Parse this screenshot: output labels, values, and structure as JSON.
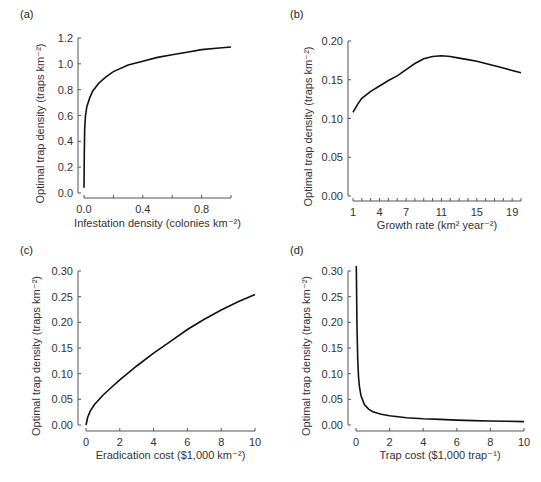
{
  "chart_data": [
    {
      "panel": "(a)",
      "type": "line",
      "xlabel": "Infestation density (colonies km⁻²)",
      "ylabel": "Optimal trap density (traps km⁻²)",
      "xlim": [
        0,
        1.0
      ],
      "ylim": [
        0,
        1.2
      ],
      "xticks": [
        "0.0",
        "0.4",
        "0.8"
      ],
      "yticks": [
        "0.0",
        "0.2",
        "0.4",
        "0.6",
        "0.8",
        "1.0",
        "1.2"
      ],
      "x": [
        0.0,
        0.002,
        0.005,
        0.01,
        0.02,
        0.04,
        0.06,
        0.1,
        0.15,
        0.2,
        0.3,
        0.4,
        0.5,
        0.6,
        0.7,
        0.8,
        0.9,
        1.0
      ],
      "y": [
        0.04,
        0.3,
        0.5,
        0.6,
        0.67,
        0.74,
        0.79,
        0.85,
        0.9,
        0.94,
        0.99,
        1.02,
        1.05,
        1.07,
        1.09,
        1.11,
        1.12,
        1.13
      ]
    },
    {
      "panel": "(b)",
      "type": "line",
      "xlabel": "Growth rate (km² year⁻²)",
      "ylabel": "Optimal trap density (traps km⁻²)",
      "xlim": [
        1,
        20
      ],
      "ylim": [
        0,
        0.2
      ],
      "xticks": [
        "1",
        "4",
        "7",
        "11",
        "15",
        "19"
      ],
      "yticks": [
        "0.00",
        "0.05",
        "0.10",
        "0.15",
        "0.20"
      ],
      "x": [
        1,
        1.5,
        2,
        3,
        4,
        5,
        6,
        7,
        8,
        9,
        10,
        11,
        12,
        13,
        14,
        15,
        16,
        17,
        18,
        19,
        20
      ],
      "y": [
        0.108,
        0.118,
        0.126,
        0.135,
        0.142,
        0.149,
        0.155,
        0.163,
        0.171,
        0.177,
        0.18,
        0.181,
        0.18,
        0.178,
        0.176,
        0.174,
        0.171,
        0.168,
        0.165,
        0.162,
        0.159
      ]
    },
    {
      "panel": "(c)",
      "type": "line",
      "xlabel": "Eradication cost ($1,000 km⁻²)",
      "ylabel": "Optimal trap density (traps km⁻²)",
      "xlim": [
        0,
        10
      ],
      "ylim": [
        0,
        0.3
      ],
      "xticks": [
        "0",
        "2",
        "4",
        "6",
        "8",
        "10"
      ],
      "yticks": [
        "0.00",
        "0.05",
        "0.10",
        "0.15",
        "0.20",
        "0.25",
        "0.30"
      ],
      "x": [
        0,
        0.1,
        0.25,
        0.5,
        1,
        1.5,
        2,
        3,
        4,
        5,
        6,
        7,
        8,
        9,
        10
      ],
      "y": [
        0.0,
        0.015,
        0.027,
        0.04,
        0.058,
        0.073,
        0.088,
        0.115,
        0.14,
        0.163,
        0.186,
        0.206,
        0.224,
        0.24,
        0.254
      ]
    },
    {
      "panel": "(d)",
      "type": "line",
      "xlabel": "Trap cost ($1,000 trap⁻¹)",
      "ylabel": "Optimal trap density (traps km⁻²)",
      "xlim": [
        0,
        10
      ],
      "ylim": [
        0,
        0.3
      ],
      "xticks": [
        "0",
        "2",
        "4",
        "6",
        "8",
        "10"
      ],
      "yticks": [
        "0.00",
        "0.05",
        "0.10",
        "0.15",
        "0.20",
        "0.25",
        "0.30"
      ],
      "x": [
        0.02,
        0.04,
        0.06,
        0.1,
        0.15,
        0.2,
        0.3,
        0.5,
        0.75,
        1,
        1.5,
        2,
        3,
        4,
        5,
        6,
        7,
        8,
        9,
        10
      ],
      "y": [
        0.31,
        0.24,
        0.19,
        0.13,
        0.095,
        0.075,
        0.057,
        0.04,
        0.031,
        0.026,
        0.021,
        0.018,
        0.014,
        0.012,
        0.011,
        0.0095,
        0.0085,
        0.0078,
        0.0072,
        0.0066
      ]
    }
  ]
}
